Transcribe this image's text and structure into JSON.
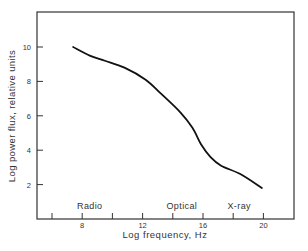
{
  "chart_data": {
    "type": "line",
    "title": "",
    "xlabel": "Log frequency,  Hz",
    "ylabel": "Log power flux,  relative units",
    "xlim": [
      5,
      22
    ],
    "ylim": [
      0,
      12
    ],
    "x_ticks": [
      6,
      8,
      10,
      12,
      14,
      16,
      18,
      20
    ],
    "x_tick_labels": [
      "",
      "8",
      "",
      "12",
      "",
      "16",
      "",
      "20"
    ],
    "y_ticks": [
      2,
      4,
      6,
      8,
      10
    ],
    "y_tick_labels": [
      "2",
      "4",
      "6",
      "8",
      "10"
    ],
    "grid": false,
    "legend": null,
    "series": [
      {
        "name": "spectrum",
        "x": [
          7.4,
          8.5,
          9.5,
          10.8,
          12.2,
          13.2,
          14.5,
          15.3,
          15.9,
          16.5,
          17.2,
          18.5,
          19.9
        ],
        "y": [
          10.0,
          9.5,
          9.2,
          8.8,
          8.1,
          7.3,
          6.2,
          5.3,
          4.3,
          3.6,
          3.1,
          2.6,
          1.8
        ]
      }
    ],
    "annotations": [
      {
        "text": "Radio",
        "x": 8.5,
        "y": 0.6
      },
      {
        "text": "Optical",
        "x": 14.6,
        "y": 0.6
      },
      {
        "text": "X-ray",
        "x": 18.4,
        "y": 0.6
      }
    ]
  }
}
